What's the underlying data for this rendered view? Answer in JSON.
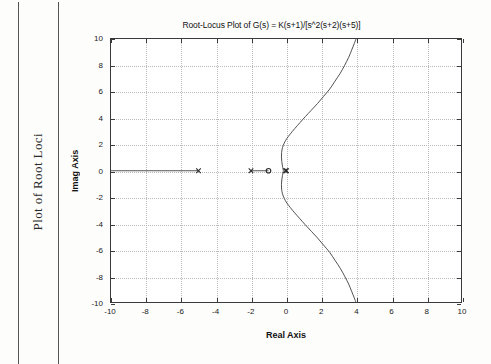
{
  "page": {
    "running_head": "Plot of Root Loci"
  },
  "chart_data": {
    "type": "line",
    "title": "Root-Locus Plot of G(s) = K(s+1)/[s^2(s+2)(s+5)]",
    "xlabel": "Real Axis",
    "ylabel": "Imag Axis",
    "xlim": [
      -10,
      10
    ],
    "ylim": [
      -10,
      10
    ],
    "grid": true,
    "legend": "none",
    "xticks": [
      -10,
      -8,
      -6,
      -4,
      -2,
      0,
      2,
      4,
      6,
      8,
      10
    ],
    "xticklabels": [
      "-10",
      "-8",
      "-6",
      "-4",
      "-2",
      "0",
      "2",
      "4",
      "6",
      "8",
      "10"
    ],
    "yticks": [
      -10,
      -8,
      -6,
      -4,
      -2,
      0,
      2,
      4,
      6,
      8,
      10
    ],
    "yticklabels": [
      "-10",
      "-8",
      "-6",
      "-4",
      "-2",
      "0",
      "2",
      "4",
      "6",
      "8",
      "10"
    ],
    "poles": [
      {
        "marker": "x",
        "x": 0,
        "y": 0,
        "multiplicity": 2
      },
      {
        "marker": "x",
        "x": -2,
        "y": 0,
        "multiplicity": 1
      },
      {
        "marker": "x",
        "x": -5,
        "y": 0,
        "multiplicity": 1
      }
    ],
    "zeros": [
      {
        "marker": "o",
        "x": -1,
        "y": 0,
        "multiplicity": 1
      }
    ],
    "series": [
      {
        "name": "real-axis-branch-left",
        "comment": "Real-axis locus segment from -5 leftwards to plot edge",
        "points": [
          [
            -10,
            0
          ],
          [
            -5,
            0
          ]
        ]
      },
      {
        "name": "real-axis-branch-center",
        "comment": "Real-axis locus segment between pole at -2 and zero at -1",
        "points": [
          [
            -2,
            0
          ],
          [
            -1,
            0
          ]
        ]
      },
      {
        "name": "complex-branch-upper",
        "comment": "Upper complex-conjugate branch departing the double pole at origin, bending right and crossing to x=4 at Im=10",
        "points": [
          [
            -0.15,
            0.0
          ],
          [
            -0.2,
            0.35
          ],
          [
            -0.24,
            0.7
          ],
          [
            -0.26,
            1.05
          ],
          [
            -0.25,
            1.4
          ],
          [
            -0.2,
            1.75
          ],
          [
            -0.1,
            2.1
          ],
          [
            0.05,
            2.45
          ],
          [
            0.25,
            2.8
          ],
          [
            0.5,
            3.2
          ],
          [
            0.8,
            3.65
          ],
          [
            1.1,
            4.1
          ],
          [
            1.45,
            4.6
          ],
          [
            1.8,
            5.1
          ],
          [
            2.15,
            5.65
          ],
          [
            2.5,
            6.2
          ],
          [
            2.8,
            6.8
          ],
          [
            3.1,
            7.4
          ],
          [
            3.35,
            8.0
          ],
          [
            3.58,
            8.6
          ],
          [
            3.75,
            9.15
          ],
          [
            3.9,
            9.65
          ],
          [
            4.0,
            10.0
          ]
        ]
      },
      {
        "name": "complex-branch-lower",
        "comment": "Lower complex-conjugate branch, mirror image of the upper branch",
        "points": [
          [
            -0.15,
            0.0
          ],
          [
            -0.2,
            -0.35
          ],
          [
            -0.24,
            -0.7
          ],
          [
            -0.26,
            -1.05
          ],
          [
            -0.25,
            -1.4
          ],
          [
            -0.2,
            -1.75
          ],
          [
            -0.1,
            -2.1
          ],
          [
            0.05,
            -2.45
          ],
          [
            0.25,
            -2.8
          ],
          [
            0.5,
            -3.2
          ],
          [
            0.8,
            -3.65
          ],
          [
            1.1,
            -4.1
          ],
          [
            1.45,
            -4.6
          ],
          [
            1.8,
            -5.1
          ],
          [
            2.15,
            -5.65
          ],
          [
            2.5,
            -6.2
          ],
          [
            2.8,
            -6.8
          ],
          [
            3.1,
            -7.4
          ],
          [
            3.35,
            -8.0
          ],
          [
            3.58,
            -8.6
          ],
          [
            3.75,
            -9.15
          ],
          [
            3.9,
            -9.65
          ],
          [
            4.0,
            -10.0
          ]
        ]
      }
    ]
  }
}
